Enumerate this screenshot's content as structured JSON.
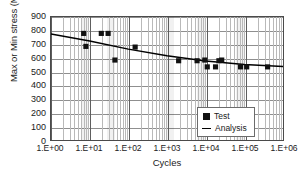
{
  "chart_data": {
    "type": "scatter",
    "title": "",
    "xlabel": "Cycles",
    "ylabel": "Max or Min stress (MPa)",
    "xscale": "log",
    "yscale": "linear",
    "xlim": [
      1,
      1000000
    ],
    "ylim": [
      0,
      900
    ],
    "ytick_values": [
      0,
      100,
      200,
      300,
      400,
      500,
      600,
      700,
      800,
      900
    ],
    "ytick_labels": [
      "0",
      "100",
      "200",
      "300",
      "400",
      "500",
      "600",
      "700",
      "800",
      "900"
    ],
    "xtick_values": [
      1,
      10,
      100,
      1000,
      10000,
      100000,
      1000000
    ],
    "xtick_labels": [
      "1.E+00",
      "1.E+01",
      "1.E+02",
      "1.E+03",
      "1.E+04",
      "1.E+05",
      "1.E+06"
    ],
    "grid": true,
    "minor_grid": true,
    "legend_position": "lower-right",
    "series": [
      {
        "name": "Test",
        "type": "scatter",
        "marker": "square",
        "color": "#111111",
        "points": [
          [
            7,
            780
          ],
          [
            8,
            685
          ],
          [
            20,
            780
          ],
          [
            30,
            780
          ],
          [
            45,
            585
          ],
          [
            150,
            680
          ],
          [
            2000,
            580
          ],
          [
            6000,
            580
          ],
          [
            9500,
            585
          ],
          [
            11000,
            535
          ],
          [
            18000,
            535
          ],
          [
            22000,
            580
          ],
          [
            26000,
            585
          ],
          [
            80000,
            535
          ],
          [
            115000,
            535
          ],
          [
            400000,
            535
          ]
        ]
      },
      {
        "name": "Analysis",
        "type": "line",
        "color": "#000000",
        "points": [
          [
            1,
            775
          ],
          [
            10,
            725
          ],
          [
            100,
            665
          ],
          [
            1000,
            617
          ],
          [
            10000,
            578
          ],
          [
            100000,
            552
          ],
          [
            1000000,
            538
          ]
        ]
      }
    ]
  },
  "legend": {
    "items": [
      {
        "label": "Test",
        "marker": "square-marker"
      },
      {
        "label": "Analysis",
        "marker": "line-marker"
      }
    ]
  }
}
